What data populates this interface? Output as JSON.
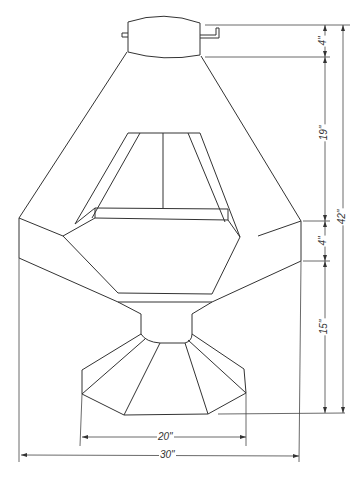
{
  "drawing": {
    "subject": "hooded fireplace elevation",
    "dimensions": {
      "collar_height": "4\"",
      "hood_height": "19\"",
      "band_height": "4\"",
      "firebox_height": "15\"",
      "overall_height": "42\"",
      "base_width": "20\"",
      "overall_width": "30\""
    }
  }
}
